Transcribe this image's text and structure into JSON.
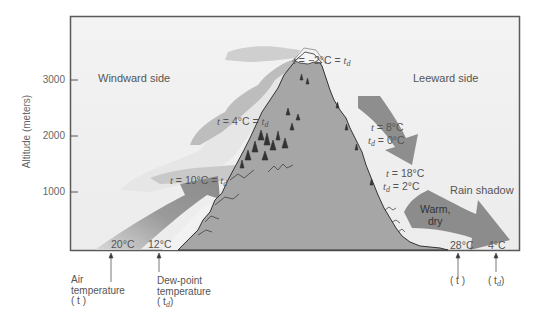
{
  "diagram": {
    "y_axis": {
      "label": "Altitude (meters)",
      "ticks": [
        "3000",
        "2000",
        "1000"
      ]
    },
    "regions": {
      "windward": "Windward side",
      "leeward": "Leeward side",
      "rain_shadow": "Rain shadow"
    },
    "windward_labels": {
      "base_air_temp": "20°C",
      "base_dew_point": "12°C",
      "level_1000": {
        "t": "t",
        "eq1": " = 10°C = ",
        "td": "t",
        "td_sub": "d"
      },
      "level_2000": {
        "t": "t",
        "eq1": " = 4°C = ",
        "td": "t",
        "td_sub": "d"
      },
      "summit": {
        "t": "t",
        "eq1": " = −2°C = ",
        "td": "t",
        "td_sub": "d"
      }
    },
    "leeward_labels": {
      "upper": {
        "t_text": " = 8°C",
        "td_text": " = 0°C"
      },
      "lower": {
        "t_text": " = 18°C",
        "td_text": " = 2°C"
      },
      "warm_dry": [
        "Warm,",
        "dry"
      ],
      "base_air_temp": "28°C",
      "base_dew_point": "4°C"
    },
    "callouts": {
      "air_temp": [
        "Air",
        "temperature",
        "( t )"
      ],
      "dew_point": [
        "Dew-point",
        "temperature",
        "( t"
      ],
      "dew_point_sub": "d",
      "right_t": "( t )",
      "right_td": "( t",
      "right_td_sub": "d"
    },
    "colors": {
      "frame_bg": "#f0f0f0",
      "frame_border": "#555555",
      "mountain": "#a9a9a9",
      "arrow": "#8a8a8a",
      "cloud": "#c4c4c4",
      "cloud_light": "#e8e8e8",
      "text": "#555555"
    }
  }
}
